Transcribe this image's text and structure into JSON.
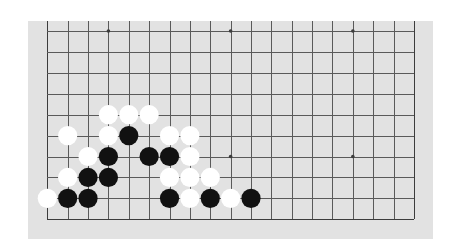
{
  "board": {
    "size": 19,
    "visible_rows": 10,
    "top_row_label": "row-10-from-bottom",
    "colors": {
      "background": "#ffffff",
      "panel": "#e2e2e2",
      "grid": "#5a5a5a",
      "black_stone": "#111111",
      "white_stone": "#ffffff"
    },
    "geometry": {
      "panel": {
        "x": 28,
        "y": 21,
        "w": 405,
        "h": 218
      },
      "origin_x": 47.3,
      "origin_y": 31,
      "col_spacing": 20.37,
      "row_spacing": 20.92,
      "stone_radius": 9.6
    },
    "star_points": [
      {
        "col": 3,
        "row": 0
      },
      {
        "col": 9,
        "row": 0
      },
      {
        "col": 15,
        "row": 0
      },
      {
        "col": 3,
        "row": 6
      },
      {
        "col": 9,
        "row": 6
      },
      {
        "col": 15,
        "row": 6
      }
    ],
    "stones": [
      {
        "color": "white",
        "col": 3,
        "row": 4
      },
      {
        "color": "white",
        "col": 4,
        "row": 4
      },
      {
        "color": "white",
        "col": 5,
        "row": 4
      },
      {
        "color": "white",
        "col": 1,
        "row": 5
      },
      {
        "color": "white",
        "col": 3,
        "row": 5
      },
      {
        "color": "black",
        "col": 4,
        "row": 5
      },
      {
        "color": "white",
        "col": 6,
        "row": 5
      },
      {
        "color": "white",
        "col": 7,
        "row": 5
      },
      {
        "color": "white",
        "col": 2,
        "row": 6
      },
      {
        "color": "black",
        "col": 3,
        "row": 6
      },
      {
        "color": "black",
        "col": 5,
        "row": 6
      },
      {
        "color": "black",
        "col": 6,
        "row": 6
      },
      {
        "color": "white",
        "col": 7,
        "row": 6
      },
      {
        "color": "white",
        "col": 1,
        "row": 7
      },
      {
        "color": "black",
        "col": 2,
        "row": 7
      },
      {
        "color": "black",
        "col": 3,
        "row": 7
      },
      {
        "color": "white",
        "col": 6,
        "row": 7
      },
      {
        "color": "white",
        "col": 7,
        "row": 7
      },
      {
        "color": "white",
        "col": 8,
        "row": 7
      },
      {
        "color": "white",
        "col": 0,
        "row": 8
      },
      {
        "color": "black",
        "col": 1,
        "row": 8
      },
      {
        "color": "black",
        "col": 2,
        "row": 8
      },
      {
        "color": "black",
        "col": 6,
        "row": 8
      },
      {
        "color": "white",
        "col": 7,
        "row": 8
      },
      {
        "color": "black",
        "col": 8,
        "row": 8
      },
      {
        "color": "white",
        "col": 9,
        "row": 8
      },
      {
        "color": "black",
        "col": 10,
        "row": 8
      }
    ]
  }
}
